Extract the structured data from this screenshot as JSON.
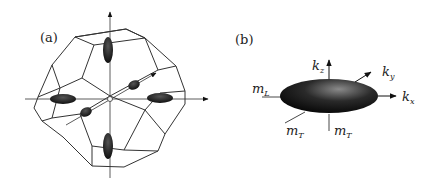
{
  "panel_a": {
    "label": "(a)",
    "description": "Brillouin zone (truncated octahedron) with six ellipsoidal constant-energy surfaces along the axes"
  },
  "panel_b": {
    "label": "(b)",
    "axes": {
      "kz": {
        "main": "k",
        "sub": "z"
      },
      "ky": {
        "main": "k",
        "sub": "y"
      },
      "kx": {
        "main": "k",
        "sub": "x"
      }
    },
    "masses": {
      "mL": {
        "main": "m",
        "sub": "L"
      },
      "mT1": {
        "main": "m",
        "sub": "T"
      },
      "mT2": {
        "main": "m",
        "sub": "T"
      }
    }
  },
  "colors": {
    "line": "#333333",
    "ellipsoid_dark": "#111111",
    "ellipsoid_highlight": "#8a8a8a"
  }
}
